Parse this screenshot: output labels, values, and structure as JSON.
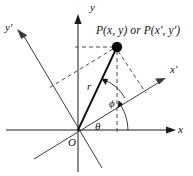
{
  "figure": {
    "type": "polar-cartesian-rotated-axes-diagram",
    "background_color": "#ffffff",
    "line_color": "#1a1a1a",
    "point_color": "#0a0a0a",
    "dash_color": "#4a4a4a",
    "width": 193,
    "height": 176
  },
  "labels": {
    "point": "P(x, y) or P(x′, y′)",
    "axis_y": "y",
    "axis_x": "x",
    "axis_y_prime": "y′",
    "axis_x_prime": "x′",
    "radius": "r",
    "angle_theta": "θ",
    "angle_phi": "ϕ",
    "origin": "O"
  },
  "geometry": {
    "origin": {
      "x": 78,
      "y": 130
    },
    "point_p": {
      "x": 117,
      "y": 47
    },
    "axis_x_end": {
      "x": 175,
      "y": 130
    },
    "axis_x_start": {
      "x": 6,
      "y": 130
    },
    "axis_y_top": {
      "x": 78,
      "y": 14
    },
    "axis_y_bottom": {
      "x": 78,
      "y": 172
    },
    "axis_x_prime_end": {
      "x": 166,
      "y": 78
    },
    "axis_x_prime_start": {
      "x": 34,
      "y": 159
    },
    "axis_y_prime_end": {
      "x": 17,
      "y": 29
    },
    "axis_y_prime_start": {
      "x": 102,
      "y": 168
    },
    "theta_degrees": 31,
    "phi_degrees": 34,
    "total_angle_degrees": 65,
    "radius_length": 92
  },
  "elements": {
    "dashed_to_y_axis": true,
    "dashed_to_x_axis": true,
    "dashed_to_x_prime_axis": true,
    "dashed_to_y_prime_axis": true,
    "arc_theta": true,
    "arc_phi": true
  }
}
